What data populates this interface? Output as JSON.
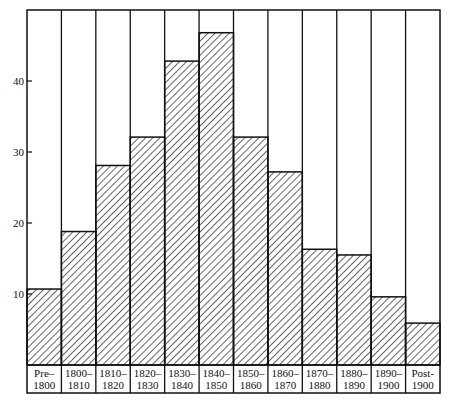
{
  "chart_data": {
    "type": "bar",
    "title": "",
    "xlabel": "",
    "ylabel": "",
    "categories": [
      [
        "Pre–",
        "1800"
      ],
      [
        "1800–",
        "1810"
      ],
      [
        "1810–",
        "1820"
      ],
      [
        "1820–",
        "1830"
      ],
      [
        "1830–",
        "1840"
      ],
      [
        "1840–",
        "1850"
      ],
      [
        "1850–",
        "1860"
      ],
      [
        "1860–",
        "1870"
      ],
      [
        "1870–",
        "1880"
      ],
      [
        "1880–",
        "1890"
      ],
      [
        "1890–",
        "1900"
      ],
      [
        "Post-",
        "1900"
      ]
    ],
    "values": [
      10.7,
      18.8,
      28.1,
      32.1,
      42.8,
      46.8,
      32.1,
      27.2,
      16.3,
      15.5,
      9.6,
      5.9
    ],
    "yticks": [
      10,
      20,
      30,
      40
    ],
    "ylim": [
      0,
      50
    ],
    "grid": false,
    "legend": null,
    "bar_fill": "diagonal-hatch",
    "colors": {
      "ink": "#111111",
      "background": "#ffffff"
    }
  }
}
